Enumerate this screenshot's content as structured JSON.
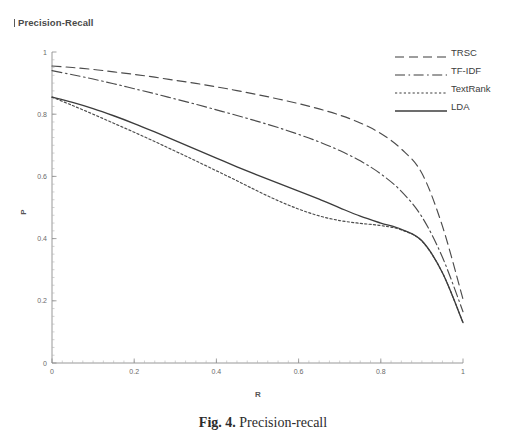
{
  "title": "Precision-Recall",
  "caption": {
    "label": "Fig. 4.",
    "text": "Precision-recall"
  },
  "axes": {
    "xlabel": "R",
    "ylabel": "P",
    "x_ticks": [
      "0",
      "0.2",
      "0.4",
      "0.6",
      "0.8",
      "1"
    ],
    "y_ticks": [
      "0",
      "0.2",
      "0.4",
      "0.6",
      "0.8",
      "1"
    ]
  },
  "legend": {
    "position": "top-right",
    "entries": [
      {
        "label": "TRSC",
        "style": "long-dash"
      },
      {
        "label": "TF-IDF",
        "style": "dash-dot"
      },
      {
        "label": "TextRank",
        "style": "short-dash"
      },
      {
        "label": "LDA",
        "style": "solid"
      }
    ]
  },
  "chart_data": {
    "type": "line",
    "title": "Precision-Recall",
    "xlabel": "R",
    "ylabel": "P",
    "xlim": [
      0,
      1
    ],
    "ylim": [
      0,
      1
    ],
    "grid": false,
    "legend_position": "top-right",
    "x": [
      0,
      0.05,
      0.1,
      0.15,
      0.2,
      0.25,
      0.3,
      0.35,
      0.4,
      0.45,
      0.5,
      0.55,
      0.6,
      0.65,
      0.7,
      0.75,
      0.8,
      0.85,
      0.9,
      0.95,
      1
    ],
    "series": [
      {
        "name": "TRSC",
        "style": "long-dash",
        "values": [
          0.955,
          0.95,
          0.944,
          0.936,
          0.928,
          0.919,
          0.909,
          0.899,
          0.888,
          0.876,
          0.863,
          0.849,
          0.834,
          0.817,
          0.797,
          0.772,
          0.738,
          0.688,
          0.61,
          0.44,
          0.205
        ]
      },
      {
        "name": "TF-IDF",
        "style": "dash-dot",
        "values": [
          0.94,
          0.927,
          0.913,
          0.898,
          0.882,
          0.866,
          0.849,
          0.832,
          0.814,
          0.796,
          0.777,
          0.757,
          0.735,
          0.711,
          0.683,
          0.65,
          0.608,
          0.552,
          0.47,
          0.34,
          0.165
        ]
      },
      {
        "name": "TextRank",
        "style": "short-dash",
        "values": [
          0.855,
          0.828,
          0.8,
          0.771,
          0.742,
          0.712,
          0.681,
          0.65,
          0.618,
          0.586,
          0.553,
          0.522,
          0.495,
          0.473,
          0.458,
          0.449,
          0.442,
          0.428,
          0.392,
          0.29,
          0.13
        ]
      },
      {
        "name": "LDA",
        "style": "solid",
        "values": [
          0.855,
          0.838,
          0.818,
          0.795,
          0.77,
          0.743,
          0.715,
          0.687,
          0.659,
          0.631,
          0.604,
          0.578,
          0.553,
          0.527,
          0.499,
          0.472,
          0.45,
          0.43,
          0.393,
          0.29,
          0.13
        ]
      }
    ]
  },
  "colors": {
    "ink": "#3c3c3c",
    "axis": "#8c8c8c",
    "background": "#ffffff"
  }
}
